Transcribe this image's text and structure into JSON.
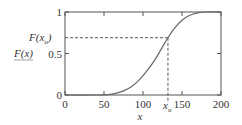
{
  "chart_data": {
    "type": "line",
    "title": "",
    "xlabel": "x",
    "ylabel": "F(x)",
    "xlim": [
      0,
      200
    ],
    "ylim": [
      0,
      1
    ],
    "grid": false,
    "legend": null,
    "x_ticks": [
      0,
      50,
      100,
      150,
      200
    ],
    "x_tick_labels": [
      "0",
      "50",
      "100",
      "150",
      "200"
    ],
    "y_ticks": [
      0,
      0.5,
      1
    ],
    "y_tick_labels": [
      "0",
      "0.5",
      "1"
    ],
    "series": [
      {
        "name": "F(x)",
        "x": [
          0,
          40,
          55,
          65,
          75,
          85,
          95,
          105,
          115,
          125,
          132,
          140,
          150,
          160,
          170,
          180,
          200
        ],
        "values": [
          0,
          0,
          0.005,
          0.02,
          0.05,
          0.1,
          0.18,
          0.29,
          0.42,
          0.58,
          0.69,
          0.8,
          0.9,
          0.96,
          0.99,
          1.0,
          1.0
        ]
      }
    ],
    "annotations": [
      {
        "type": "hline-dashed",
        "y": 0.69,
        "x_from": 0,
        "x_to": 132,
        "label": "F(x_u)"
      },
      {
        "type": "vline-dashed",
        "x": 132,
        "y_from": 0,
        "y_to": 0.69,
        "label": "x_u"
      }
    ]
  },
  "labels": {
    "y_axis": "F(x)",
    "x_axis": "x",
    "fxu_main": "F(x",
    "fxu_sub": "u",
    "fxu_close": ")",
    "xu_main": "x",
    "xu_sub": "u"
  }
}
